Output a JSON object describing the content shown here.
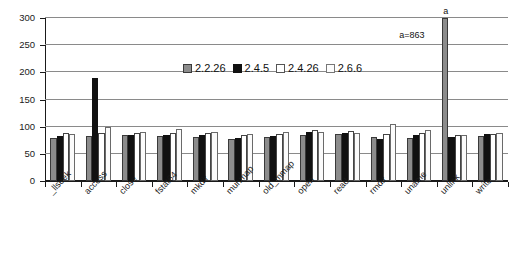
{
  "chart_data": {
    "type": "bar",
    "title": "",
    "xlabel": "",
    "ylabel": "",
    "ylim": [
      0,
      300
    ],
    "yticks": [
      0,
      50,
      100,
      150,
      200,
      250,
      300
    ],
    "ytick_labels": [
      "0",
      "50",
      "100",
      "150",
      "200",
      "250",
      "300"
    ],
    "grid": true,
    "legend_position": "inside-top-center",
    "categories": [
      "_llseek",
      "access",
      "close",
      "fstat64",
      "mkdir",
      "munmap",
      "old_mmap",
      "open",
      "read",
      "rmdir",
      "uname",
      "unlink",
      "write"
    ],
    "series": [
      {
        "name": "2.2.26",
        "color": "#8c8c8c",
        "values": [
          80,
          83,
          84,
          82,
          81,
          78,
          81,
          84,
          87,
          81,
          79,
          863,
          83
        ]
      },
      {
        "name": "2.4.5",
        "color": "#111111",
        "values": [
          83,
          190,
          85,
          85,
          85,
          80,
          83,
          91,
          88,
          78,
          84,
          81,
          87
        ]
      },
      {
        "name": "2.4.26",
        "color": "#ffffff",
        "values": [
          88,
          88,
          88,
          88,
          88,
          84,
          86,
          93,
          92,
          86,
          88,
          85,
          86
        ]
      },
      {
        "name": "2.6.6",
        "color": "#fbfbfb",
        "values": [
          87,
          100,
          91,
          96,
          91,
          87,
          91,
          91,
          88,
          105,
          94,
          84,
          88
        ]
      }
    ],
    "annotations": [
      {
        "marker": "a",
        "label": "a=863",
        "category": "unlink",
        "series": "2.2.26",
        "note": "bar truncated at axis maximum"
      }
    ]
  }
}
